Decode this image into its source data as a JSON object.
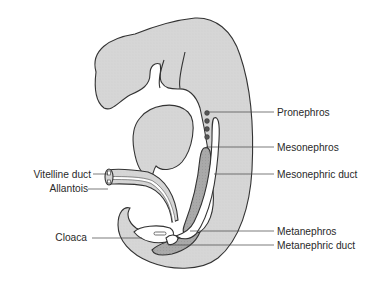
{
  "figure": {
    "colors": {
      "body_fill": "#d6d6d6",
      "dark_fill": "#a8a8a8",
      "lumen_fill": "#ffffff",
      "outline": "#333333",
      "dot_fill": "#555555",
      "label_text": "#2a2a2a"
    }
  },
  "labels": {
    "right": [
      {
        "id": "pronephros",
        "text": "Pronephros"
      },
      {
        "id": "mesonephros",
        "text": "Mesonephros"
      },
      {
        "id": "mesonephric_duct",
        "text": "Mesonephric duct"
      },
      {
        "id": "metanephros",
        "text": "Metanephros"
      },
      {
        "id": "metanephric_duct",
        "text": "Metanephric duct"
      }
    ],
    "left": [
      {
        "id": "vitelline_duct",
        "text": "Vitelline duct"
      },
      {
        "id": "allantois",
        "text": "Allantois"
      },
      {
        "id": "cloaca",
        "text": "Cloaca"
      }
    ]
  }
}
